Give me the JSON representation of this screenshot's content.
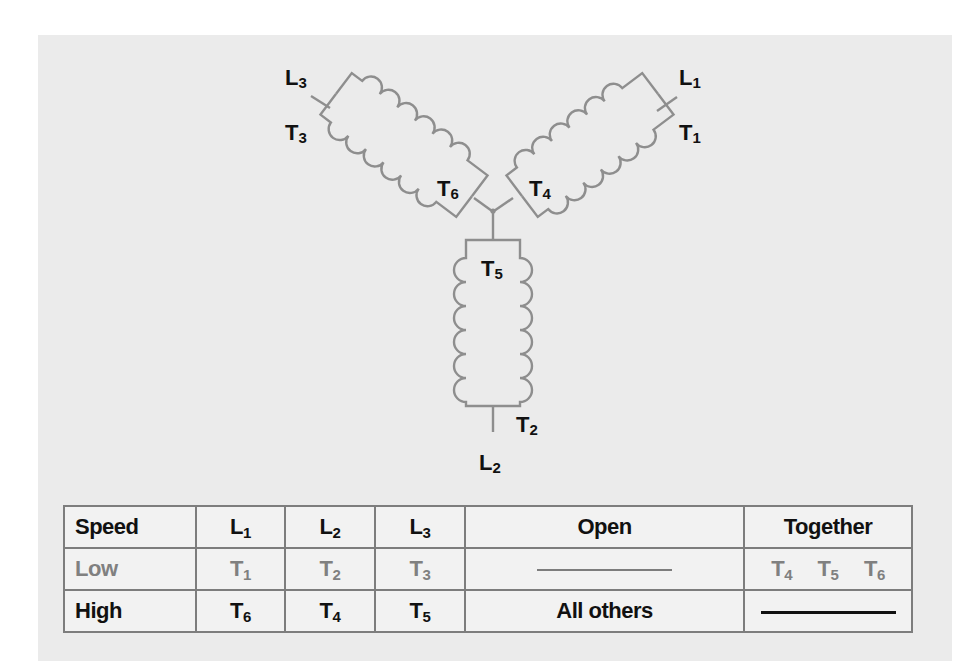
{
  "diagram": {
    "colors": {
      "panel_bg": "#ebebeb",
      "coil_stroke": "#8e8e8e",
      "label_text": "#111111",
      "low_row_text": "#808080",
      "table_border": "#7d7d7d"
    },
    "labels": {
      "L3": {
        "main": "L",
        "sub": "3"
      },
      "T3": {
        "main": "T",
        "sub": "3"
      },
      "L1": {
        "main": "L",
        "sub": "1"
      },
      "T1": {
        "main": "T",
        "sub": "1"
      },
      "T6": {
        "main": "T",
        "sub": "6"
      },
      "T4": {
        "main": "T",
        "sub": "4"
      },
      "T5": {
        "main": "T",
        "sub": "5"
      },
      "T2": {
        "main": "T",
        "sub": "2"
      },
      "L2": {
        "main": "L",
        "sub": "2"
      }
    }
  },
  "table": {
    "header": {
      "speed": "Speed",
      "l1": {
        "main": "L",
        "sub": "1"
      },
      "l2": {
        "main": "L",
        "sub": "2"
      },
      "l3": {
        "main": "L",
        "sub": "3"
      },
      "open": "Open",
      "together": "Together"
    },
    "rows": [
      {
        "speed": "Low",
        "l1": {
          "main": "T",
          "sub": "1"
        },
        "l2": {
          "main": "T",
          "sub": "2"
        },
        "l3": {
          "main": "T",
          "sub": "3"
        },
        "open": "—",
        "together": [
          {
            "main": "T",
            "sub": "4"
          },
          {
            "main": "T",
            "sub": "5"
          },
          {
            "main": "T",
            "sub": "6"
          }
        ]
      },
      {
        "speed": "High",
        "l1": {
          "main": "T",
          "sub": "6"
        },
        "l2": {
          "main": "T",
          "sub": "4"
        },
        "l3": {
          "main": "T",
          "sub": "5"
        },
        "open": "All others",
        "together": "—"
      }
    ]
  }
}
